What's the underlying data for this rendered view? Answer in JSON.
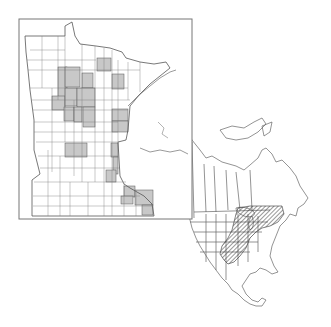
{
  "figure": {
    "type": "distribution-map",
    "panels": [
      {
        "id": "minnesota-county-map",
        "description": "Minnesota county outline map with shaded counties indicating recorded occurrences",
        "fill_shaded": "#c8c8c8",
        "fill_unshaded": "#ffffff",
        "line_color": "#555555",
        "frame_color": "#777777"
      },
      {
        "id": "north-america-range-map",
        "description": "North America state/province outline map with hatched range area in the central and eastern United States and southern Great Lakes region",
        "hatch_color": "#333333",
        "line_color": "#666666"
      }
    ]
  },
  "colors": {
    "background": "#ffffff",
    "shaded": "#c8c8c8",
    "outline": "#555555",
    "frame": "#777777",
    "hatch": "#333333"
  }
}
